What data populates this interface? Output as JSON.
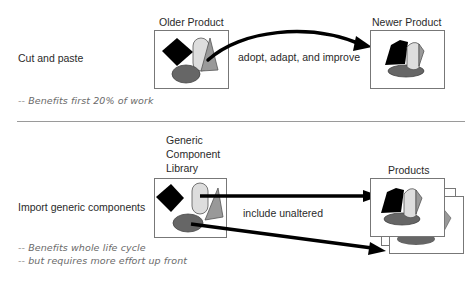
{
  "section_cut_paste": {
    "label": "Cut and paste",
    "source_label": "Older Product",
    "target_label": "Newer Product",
    "arrow_label": "adopt, adapt, and improve",
    "notes": [
      "-- Benefits first 20% of work"
    ]
  },
  "section_import": {
    "label": "Import generic components",
    "source_label_lines": [
      "Generic",
      "Component",
      "Library"
    ],
    "target_label": "Products",
    "arrow_label": "include unaltered",
    "notes": [
      "-- Benefits whole life cycle",
      "-- but requires more effort up front"
    ]
  },
  "icons": {
    "shapes": [
      "diamond-black",
      "capsule-light-gray",
      "triangle-gray",
      "ellipse-dark-gray"
    ]
  },
  "colors": {
    "black": "#000000",
    "light_gray": "#dddddd",
    "mid_gray": "#999999",
    "dark_gray": "#666666",
    "border": "#777777",
    "note_text": "#6a6a6a"
  }
}
